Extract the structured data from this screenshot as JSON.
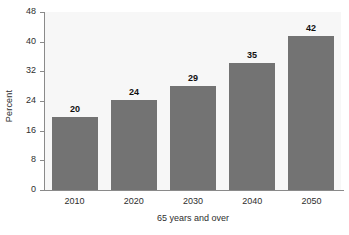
{
  "chart_data": {
    "type": "bar",
    "title": "",
    "subtitle": "",
    "xlabel": "65 years and over",
    "ylabel": "Percent",
    "categories": [
      "2010",
      "2020",
      "2030",
      "2040",
      "2050"
    ],
    "values": [
      20,
      24,
      29,
      35,
      42
    ],
    "bar_heights_plotted": [
      19.7,
      24.2,
      28.0,
      34.3,
      41.6
    ],
    "data_labels": [
      "20",
      "24",
      "29",
      "35",
      "42"
    ],
    "ylim": [
      0,
      48
    ],
    "yticks": [
      0,
      8,
      16,
      24,
      32,
      40,
      48
    ],
    "ytick_labels": [
      "0",
      "8",
      "16",
      "24",
      "32",
      "40",
      "48"
    ],
    "grid": false,
    "legend": null,
    "series": [
      {
        "name": "Percent of population 65 years and over",
        "values": [
          20,
          24,
          29,
          35,
          42
        ]
      }
    ],
    "colors": {
      "bar_fill": "#737373",
      "plot_background": "#f7f7f7",
      "figure_background": "#ffffff",
      "axis_line": "#8a8a8a",
      "tick_label_text": "#2e2e2e",
      "data_label_text": "#111111"
    }
  }
}
